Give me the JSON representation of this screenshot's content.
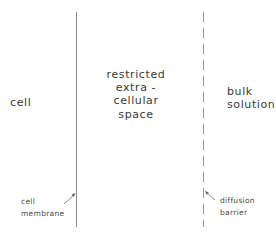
{
  "diagram": {
    "regions": {
      "cell": "cell",
      "restricted_space": "restricted\nextra -\ncellular\nspace",
      "bulk_solution": "bulk\nsolution"
    },
    "boundaries": {
      "membrane": {
        "label": "cell\nmembrane",
        "style": "solid"
      },
      "barrier": {
        "label": "diffusion\nbarrier",
        "style": "dashed"
      }
    },
    "colors": {
      "line": "#8a8a8a",
      "text": "#3a3a3a"
    }
  }
}
